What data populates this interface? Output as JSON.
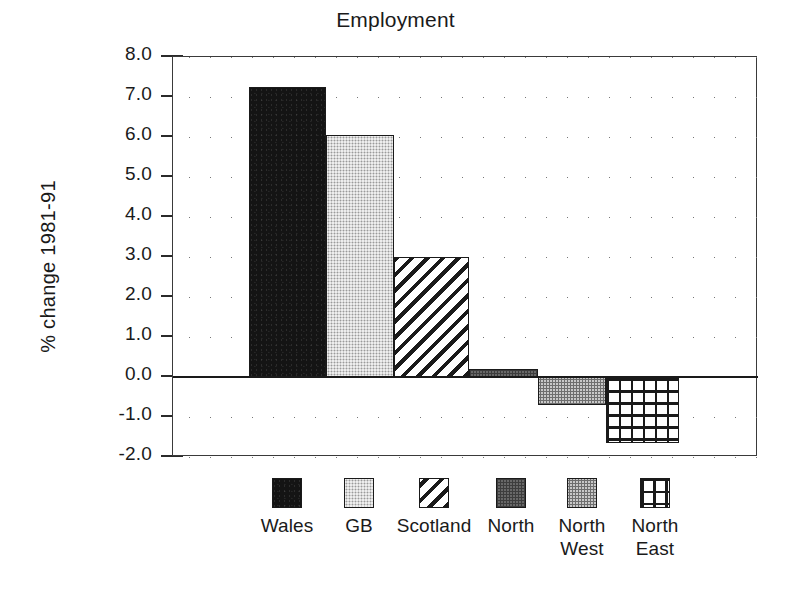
{
  "chart_data": {
    "type": "bar",
    "title": "Employment",
    "xlabel": "",
    "ylabel": "% change 1981-91",
    "categories": [
      "Wales",
      "GB",
      "Scotland",
      "North",
      "North West",
      "North East"
    ],
    "values": [
      7.25,
      6.05,
      3.0,
      0.2,
      -0.7,
      -1.65
    ],
    "ylim": [
      -2.0,
      8.0
    ],
    "ytick_labels": [
      "8.0",
      "7.0",
      "6.0",
      "5.0",
      "4.0",
      "3.0",
      "2.0",
      "1.0",
      "0.0",
      "-1.0",
      "-2.0"
    ],
    "ytick_values": [
      8.0,
      7.0,
      6.0,
      5.0,
      4.0,
      3.0,
      2.0,
      1.0,
      0.0,
      -1.0,
      -2.0
    ],
    "grid": true,
    "grid_style": "dotted-horizontal",
    "zero_line": true,
    "legend_position": "bottom",
    "series": [
      {
        "name": "Wales",
        "value": 7.25,
        "pattern": "solid-black",
        "color": "#141414"
      },
      {
        "name": "GB",
        "value": 6.05,
        "pattern": "light-stipple",
        "color": "#d9d9d9"
      },
      {
        "name": "Scotland",
        "value": 3.0,
        "pattern": "diagonal-hatch",
        "color": "#ffffff"
      },
      {
        "name": "North",
        "value": 0.2,
        "pattern": "dark-stipple",
        "color": "#3d3d3d"
      },
      {
        "name": "North West",
        "value": -0.7,
        "pattern": "medium-stipple",
        "color": "#a8a8a8"
      },
      {
        "name": "North East",
        "value": -1.65,
        "pattern": "grid-crosshatch",
        "color": "#ffffff"
      }
    ]
  },
  "title": "Employment",
  "y_axis": {
    "label": "% change 1981-91",
    "ticks": [
      {
        "label": "8.0"
      },
      {
        "label": "7.0"
      },
      {
        "label": "6.0"
      },
      {
        "label": "5.0"
      },
      {
        "label": "4.0"
      },
      {
        "label": "3.0"
      },
      {
        "label": "2.0"
      },
      {
        "label": "1.0"
      },
      {
        "label": "0.0"
      },
      {
        "label": "-1.0"
      },
      {
        "label": "-2.0"
      }
    ]
  },
  "legend": {
    "items": [
      {
        "label": "Wales"
      },
      {
        "label": "GB"
      },
      {
        "label": "Scotland"
      },
      {
        "label": "North"
      },
      {
        "label": "North\nWest"
      },
      {
        "label": "North\nEast"
      }
    ]
  }
}
